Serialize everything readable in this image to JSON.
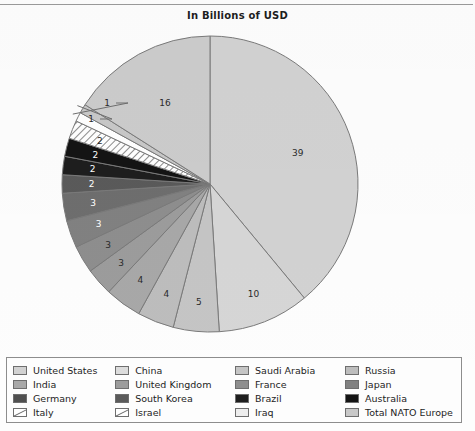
{
  "page": {
    "background_color": "#fdfdfd",
    "frame_line_color": "#9a9a9a"
  },
  "header": {
    "title": "In Billions of USD"
  },
  "chart_data": {
    "type": "pie",
    "title": "In Billions of USD",
    "xlabel": "",
    "ylabel": "",
    "units": "Billions of USD",
    "legend_position": "bottom",
    "grid": false,
    "start_angle_deg": 0,
    "direction": "clockwise",
    "total": 100,
    "categories": [
      "United States",
      "China",
      "Saudi Arabia",
      "Russia",
      "India",
      "United Kingdom",
      "France",
      "Japan",
      "Germany",
      "South Korea",
      "Brazil",
      "Australia",
      "Israel",
      "Italy",
      "Iraq",
      "Total NATO Europe"
    ],
    "values": [
      39,
      10,
      5,
      4,
      4,
      3,
      3,
      3,
      3,
      2,
      2,
      2,
      2,
      1,
      1,
      16
    ],
    "labels": [
      "39",
      "10",
      "5",
      "4",
      "4",
      "3",
      "3",
      "3",
      "3",
      "2",
      "2",
      "2",
      "2",
      "1",
      "1",
      "16"
    ],
    "colors": [
      "#d2d2d2",
      "#d6d6d6",
      "#c5c5c5",
      "#bdbdbd",
      "#a8a8a8",
      "#9c9c9c",
      "#8e8e8e",
      "#818181",
      "#6e6e6e",
      "#5a5a5a",
      "#1e1e1e",
      "#141414",
      "#ffffff",
      "#ffffff",
      "#c8c8c8"
    ],
    "slice_styles": {
      "Israel": "diagonal-hatch",
      "Italy": "solid-white"
    },
    "label_colors": {
      "dark_text": "#2a2a2a",
      "light_text": "#ffffff"
    },
    "leader_line_labels": [
      "1",
      "1"
    ],
    "slice_edge_color": "#7a7a7a"
  },
  "legend": {
    "columns": [
      {
        "items": [
          {
            "label": "United States",
            "color": "#d2d2d2",
            "pattern": "solid"
          },
          {
            "label": "India",
            "color": "#a8a8a8",
            "pattern": "solid"
          },
          {
            "label": "Germany",
            "color": "#4f4f4f",
            "pattern": "solid"
          },
          {
            "label": "Italy",
            "color": "#ffffff",
            "pattern": "diagonal"
          }
        ]
      },
      {
        "items": [
          {
            "label": "China",
            "color": "#dcdcdc",
            "pattern": "solid"
          },
          {
            "label": "United Kingdom",
            "color": "#9c9c9c",
            "pattern": "solid"
          },
          {
            "label": "South Korea",
            "color": "#5a5a5a",
            "pattern": "solid"
          },
          {
            "label": "Israel",
            "color": "#ffffff",
            "pattern": "diagonal"
          }
        ]
      },
      {
        "items": [
          {
            "label": "Saudi Arabia",
            "color": "#c5c5c5",
            "pattern": "solid"
          },
          {
            "label": "France",
            "color": "#8e8e8e",
            "pattern": "solid"
          },
          {
            "label": "Brazil",
            "color": "#1e1e1e",
            "pattern": "solid"
          },
          {
            "label": "Iraq",
            "color": "#ededed",
            "pattern": "solid"
          }
        ]
      },
      {
        "items": [
          {
            "label": "Russia",
            "color": "#bdbdbd",
            "pattern": "solid"
          },
          {
            "label": "Japan",
            "color": "#818181",
            "pattern": "solid"
          },
          {
            "label": "Australia",
            "color": "#141414",
            "pattern": "solid"
          },
          {
            "label": "Total NATO Europe",
            "color": "#c8c8c8",
            "pattern": "solid"
          }
        ]
      }
    ]
  }
}
